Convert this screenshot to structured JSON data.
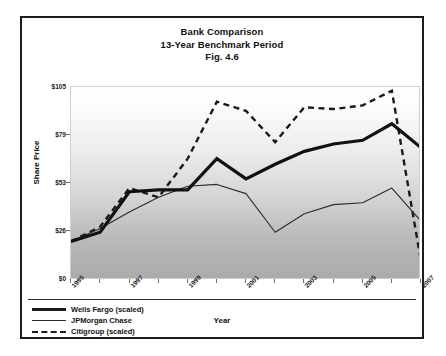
{
  "figure": {
    "title_line1": "Bank Comparison",
    "title_line2": "13-Year Benchmark Period",
    "title_line3": "Fig. 4.6"
  },
  "axes": {
    "ylabel": "Share Price",
    "xlabel": "Year",
    "ytick_labels": [
      "$105",
      "$79",
      "$53",
      "$26",
      "$0"
    ],
    "xtick_labels": [
      "1995",
      "1997",
      "1999",
      "2001",
      "2003",
      "2005",
      "2007"
    ]
  },
  "legend": {
    "items": [
      {
        "label": "Wells Fargo (scaled)",
        "style": "thick-solid"
      },
      {
        "label": "JPMorgan Chase",
        "style": "thin-solid"
      },
      {
        "label": "Citigroup (scaled)",
        "style": "dashed"
      }
    ]
  },
  "chart_data": {
    "type": "line",
    "title": "Bank Comparison 13-Year Benchmark Period Fig. 4.6",
    "xlabel": "Year",
    "ylabel": "Share Price",
    "ylim": [
      0,
      105
    ],
    "yticks": [
      0,
      26,
      53,
      79,
      105
    ],
    "grid": false,
    "legend_position": "bottom-left",
    "x": [
      1995,
      1996,
      1997,
      1998,
      1999,
      2000,
      2001,
      2002,
      2003,
      2004,
      2005,
      2006,
      2007
    ],
    "series": [
      {
        "name": "Wells Fargo (scaled)",
        "style": "thick-solid",
        "values": [
          21,
          26,
          48,
          49,
          49,
          66,
          55,
          63,
          70,
          74,
          76,
          85,
          72
        ]
      },
      {
        "name": "JPMorgan Chase",
        "style": "thin-solid",
        "values": [
          21,
          28,
          37,
          45,
          51,
          52,
          47,
          26,
          36,
          41,
          42,
          50,
          32
        ]
      },
      {
        "name": "Citigroup (scaled)",
        "style": "dashed",
        "values": [
          21,
          29,
          50,
          45,
          66,
          97,
          92,
          75,
          94,
          93,
          95,
          103,
          10
        ]
      }
    ]
  }
}
